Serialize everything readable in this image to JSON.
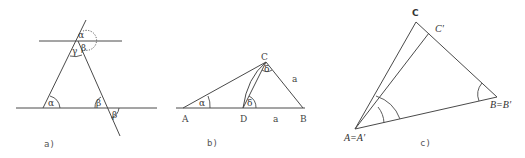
{
  "panels": {
    "a": {
      "caption": "a)",
      "angles": {
        "top_alpha": "α",
        "top_beta": "β",
        "top_gamma": "γ",
        "bottom_left_alpha": "α",
        "bottom_right_beta": "β",
        "bottom_right_beta_prime": "β"
      }
    },
    "b": {
      "caption": "b)",
      "points": {
        "A": "A",
        "B": "B",
        "C": "C",
        "D": "D"
      },
      "angles": {
        "alpha": "α",
        "delta_at_D": "δ",
        "delta_at_C": "δ"
      },
      "sides": {
        "DB": "a",
        "CB": "a"
      }
    },
    "c": {
      "caption": "c)",
      "points": {
        "A": "A=A′",
        "B": "B=B′",
        "C": "C",
        "C_prime": "C′"
      }
    }
  }
}
